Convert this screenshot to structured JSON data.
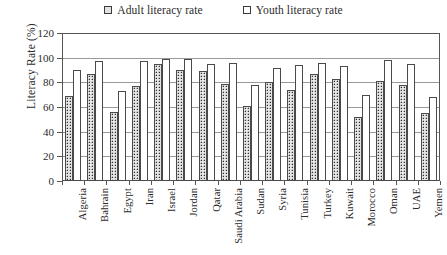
{
  "chart_data": {
    "type": "bar",
    "title": "",
    "xlabel": "",
    "ylabel": "Literacy Rate (%)",
    "ylim": [
      0,
      120
    ],
    "yticks": [
      0,
      20,
      40,
      60,
      80,
      100,
      120
    ],
    "grid": true,
    "legend_position": "top-center",
    "categories": [
      "Algeria",
      "Bahrain",
      "Egypt",
      "Iran",
      "Israel",
      "Jordan",
      "Qatar",
      "Saudi Arabia",
      "Sudan",
      "Syria",
      "Tunisia",
      "Turkey",
      "Kuwait",
      "Morocco",
      "Oman",
      "UAE",
      "Yemen"
    ],
    "series": [
      {
        "name": "Adult literacy rate",
        "marker": "hatched-square",
        "values": [
          69,
          87,
          56,
          77,
          95,
          90,
          89,
          79,
          61,
          80,
          74,
          87,
          83,
          52,
          81,
          78,
          55
        ]
      },
      {
        "name": "Youth literacy rate",
        "marker": "empty-square",
        "values": [
          90,
          97,
          73,
          97,
          99,
          99,
          95,
          96,
          78,
          92,
          94,
          96,
          93,
          70,
          98,
          95,
          68
        ]
      }
    ]
  },
  "legend": {
    "entries": [
      {
        "label": "Adult literacy rate"
      },
      {
        "label": "Youth literacy rate"
      }
    ]
  },
  "colors": {
    "axis": "#555555",
    "gridline": "#9a9a9a",
    "adult_fill": "#e4e4e4",
    "youth_fill": "#ffffff",
    "text": "#2b2b2b"
  }
}
